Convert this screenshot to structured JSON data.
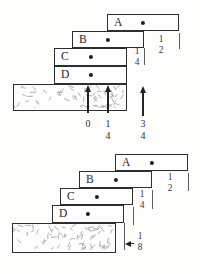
{
  "colors": {
    "ink": "#2e2e2e",
    "texture": "#a6a6a6",
    "paper": "#fdfdfc"
  },
  "figure_top": {
    "blocks": [
      {
        "label": "A"
      },
      {
        "label": "B"
      },
      {
        "label": "C"
      },
      {
        "label": "D"
      }
    ],
    "overhang_fractions": {
      "a_over_b": {
        "num": "1",
        "den": "2"
      },
      "b_over_c": {
        "num": "1",
        "den": "4"
      }
    },
    "position_markers": [
      {
        "num": "0",
        "den": ""
      },
      {
        "num": "1",
        "den": "4"
      },
      {
        "num": "3",
        "den": "4"
      }
    ]
  },
  "figure_bottom": {
    "blocks": [
      {
        "label": "A"
      },
      {
        "label": "B"
      },
      {
        "label": "C"
      },
      {
        "label": "D"
      }
    ],
    "overhang_fractions": {
      "a_over_b": {
        "num": "1",
        "den": "2"
      },
      "b_over_c": {
        "num": "1",
        "den": "4"
      },
      "d_over_table": {
        "num": "1",
        "den": "8"
      }
    }
  }
}
